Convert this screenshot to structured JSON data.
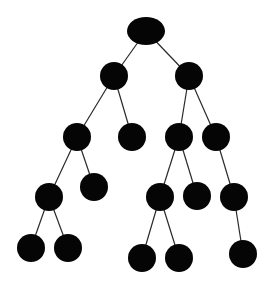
{
  "diagram": {
    "type": "tree",
    "colors": {
      "node": "#050505",
      "edge": "#2a2a2a",
      "background": "#ffffff"
    },
    "nodes": [
      {
        "id": "n0",
        "x": 146,
        "y": 31,
        "rx": 19,
        "ry": 14
      },
      {
        "id": "n1",
        "x": 114,
        "y": 76,
        "rx": 14,
        "ry": 14
      },
      {
        "id": "n2",
        "x": 189,
        "y": 76,
        "rx": 14,
        "ry": 14
      },
      {
        "id": "n3",
        "x": 77,
        "y": 137,
        "rx": 14,
        "ry": 14
      },
      {
        "id": "n4",
        "x": 132,
        "y": 137,
        "rx": 14,
        "ry": 14
      },
      {
        "id": "n5",
        "x": 179,
        "y": 137,
        "rx": 14,
        "ry": 14
      },
      {
        "id": "n6",
        "x": 216,
        "y": 137,
        "rx": 14,
        "ry": 14
      },
      {
        "id": "n7",
        "x": 49,
        "y": 197,
        "rx": 14,
        "ry": 14
      },
      {
        "id": "n8",
        "x": 94,
        "y": 187,
        "rx": 14,
        "ry": 14
      },
      {
        "id": "n9",
        "x": 160,
        "y": 197,
        "rx": 14,
        "ry": 14
      },
      {
        "id": "n10",
        "x": 197,
        "y": 196,
        "rx": 14,
        "ry": 14
      },
      {
        "id": "n11",
        "x": 234,
        "y": 197,
        "rx": 14,
        "ry": 14
      },
      {
        "id": "n12",
        "x": 31,
        "y": 248,
        "rx": 14,
        "ry": 14
      },
      {
        "id": "n13",
        "x": 68,
        "y": 248,
        "rx": 14,
        "ry": 14
      },
      {
        "id": "n14",
        "x": 142,
        "y": 258,
        "rx": 14,
        "ry": 14
      },
      {
        "id": "n15",
        "x": 179,
        "y": 258,
        "rx": 14,
        "ry": 14
      },
      {
        "id": "n16",
        "x": 243,
        "y": 254,
        "rx": 14,
        "ry": 14
      }
    ],
    "edges": [
      [
        "n0",
        "n1"
      ],
      [
        "n0",
        "n2"
      ],
      [
        "n1",
        "n3"
      ],
      [
        "n1",
        "n4"
      ],
      [
        "n2",
        "n5"
      ],
      [
        "n2",
        "n6"
      ],
      [
        "n3",
        "n7"
      ],
      [
        "n3",
        "n8"
      ],
      [
        "n5",
        "n9"
      ],
      [
        "n5",
        "n10"
      ],
      [
        "n6",
        "n11"
      ],
      [
        "n7",
        "n12"
      ],
      [
        "n7",
        "n13"
      ],
      [
        "n9",
        "n14"
      ],
      [
        "n9",
        "n15"
      ],
      [
        "n11",
        "n16"
      ]
    ]
  }
}
